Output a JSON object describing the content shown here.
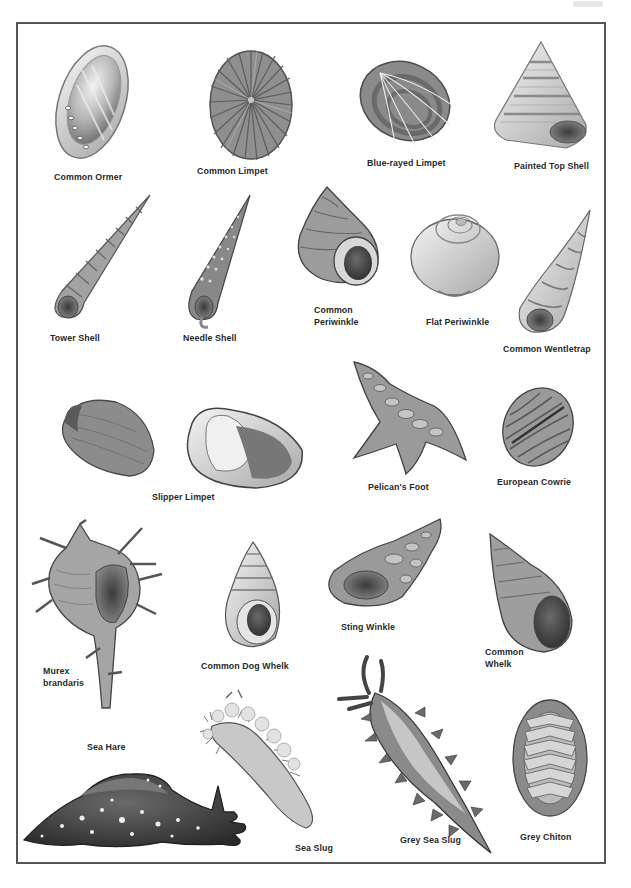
{
  "page": {
    "page_mark": ""
  },
  "specimens": [
    {
      "id": "common-ormer",
      "label": "Common Ormer"
    },
    {
      "id": "common-limpet",
      "label": "Common Limpet"
    },
    {
      "id": "blue-rayed-limpet",
      "label": "Blue-rayed Limpet"
    },
    {
      "id": "painted-top-shell",
      "label": "Painted Top Shell"
    },
    {
      "id": "tower-shell",
      "label": "Tower Shell"
    },
    {
      "id": "needle-shell",
      "label": "Needle Shell"
    },
    {
      "id": "common-periwinkle",
      "label": "Common Periwinkle",
      "lines": [
        "Common",
        "Periwinkle"
      ]
    },
    {
      "id": "flat-periwinkle",
      "label": "Flat Periwinkle"
    },
    {
      "id": "common-wentletrap",
      "label": "Common Wentletrap"
    },
    {
      "id": "slipper-limpet",
      "label": "Slipper Limpet"
    },
    {
      "id": "pelicans-foot",
      "label": "Pelican's Foot"
    },
    {
      "id": "european-cowrie",
      "label": "European Cowrie"
    },
    {
      "id": "murex-brandaris",
      "label": "Murex brandaris",
      "lines": [
        "Murex",
        "brandaris"
      ]
    },
    {
      "id": "common-dog-whelk",
      "label": "Common Dog Whelk"
    },
    {
      "id": "sting-winkle",
      "label": "Sting Winkle"
    },
    {
      "id": "common-whelk",
      "label": "Common Whelk",
      "lines": [
        "Common",
        "Whelk"
      ]
    },
    {
      "id": "sea-hare",
      "label": "Sea Hare"
    },
    {
      "id": "sea-slug",
      "label": "Sea Slug"
    },
    {
      "id": "grey-sea-slug",
      "label": "Grey Sea Slug"
    },
    {
      "id": "grey-chiton",
      "label": "Grey Chiton"
    }
  ],
  "colors": {
    "frame": "#555555",
    "label_text": "#2a2a2a",
    "shell_light": "#d9d9d9",
    "shell_mid": "#9a9a9a",
    "shell_dark": "#4a4a4a"
  }
}
